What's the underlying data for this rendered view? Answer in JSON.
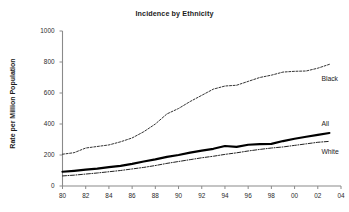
{
  "chart_data": {
    "type": "line",
    "title": "Incidence by Ethnicity",
    "xlabel": "",
    "ylabel": "Rate per Million Population",
    "xlim": [
      1980,
      2004
    ],
    "ylim": [
      0,
      1000
    ],
    "yticks": [
      0,
      200,
      400,
      600,
      800,
      1000
    ],
    "ytick_labels": [
      "0",
      "200",
      "400",
      "600",
      "800",
      "1000"
    ],
    "xticks": [
      1980,
      1982,
      1984,
      1986,
      1988,
      1990,
      1992,
      1994,
      1996,
      1998,
      2000,
      2002,
      2004
    ],
    "xtick_labels": [
      "80",
      "82",
      "84",
      "86",
      "88",
      "90",
      "92",
      "94",
      "96",
      "98",
      "00",
      "02",
      "04"
    ],
    "grid": false,
    "legend_position": "inline-right",
    "x": [
      1980,
      1981,
      1982,
      1983,
      1984,
      1985,
      1986,
      1987,
      1988,
      1989,
      1990,
      1991,
      1992,
      1993,
      1994,
      1995,
      1996,
      1997,
      1998,
      1999,
      2000,
      2001,
      2002,
      2003
    ],
    "series": [
      {
        "name": "Black",
        "label": "Black",
        "style": "dashed",
        "color": "#333333",
        "width": 1.0,
        "values": [
          205,
          215,
          245,
          255,
          265,
          285,
          310,
          350,
          400,
          465,
          500,
          545,
          585,
          625,
          645,
          650,
          675,
          700,
          715,
          735,
          740,
          742,
          760,
          785
        ]
      },
      {
        "name": "All",
        "label": "All",
        "style": "solid",
        "color": "#000000",
        "width": 2.2,
        "values": [
          92,
          98,
          105,
          112,
          122,
          130,
          143,
          158,
          172,
          188,
          200,
          215,
          228,
          240,
          258,
          252,
          266,
          270,
          272,
          290,
          305,
          318,
          330,
          342
        ]
      },
      {
        "name": "White",
        "label": "White",
        "style": "dashdot",
        "color": "#222222",
        "width": 1.0,
        "values": [
          65,
          70,
          77,
          84,
          92,
          100,
          110,
          120,
          132,
          146,
          158,
          170,
          182,
          192,
          204,
          214,
          226,
          236,
          245,
          252,
          262,
          272,
          282,
          288
        ]
      }
    ],
    "annotations": [
      {
        "text": "Black",
        "series": "Black"
      },
      {
        "text": "All",
        "series": "All"
      },
      {
        "text": "White",
        "series": "White"
      }
    ]
  },
  "axes": {
    "y_axis_name": "y-axis",
    "x_axis_name": "x-axis"
  }
}
